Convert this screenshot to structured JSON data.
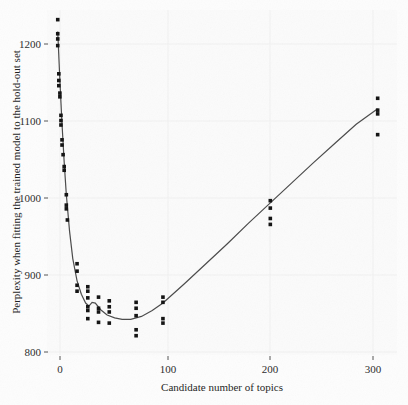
{
  "chart_data": {
    "type": "scatter",
    "title": "",
    "xlabel": "Candidate number of topics",
    "ylabel": "Perplexity when fitting the trained model to the hold-out set",
    "xlim": [
      -8,
      318
    ],
    "ylim": [
      780,
      1245
    ],
    "xticks": [
      0,
      100,
      200,
      300
    ],
    "xticklabels": [
      "0",
      "100",
      "200",
      "300"
    ],
    "yticks": [
      800,
      900,
      1000,
      1100,
      1200
    ],
    "yticklabels": [
      "800",
      "900",
      "1000",
      "1100",
      "1200"
    ],
    "grid": true,
    "legend": null,
    "point_color": "#111111",
    "line_color": "#4a4a4a",
    "panel_color": "#fbfbfb",
    "points": [
      {
        "x": 2,
        "y": 1232
      },
      {
        "x": 2,
        "y": 1213
      },
      {
        "x": 2,
        "y": 1206
      },
      {
        "x": 2,
        "y": 1197
      },
      {
        "x": 3,
        "y": 1159
      },
      {
        "x": 3,
        "y": 1150
      },
      {
        "x": 3,
        "y": 1143
      },
      {
        "x": 4,
        "y": 1133
      },
      {
        "x": 4,
        "y": 1128
      },
      {
        "x": 5,
        "y": 1103
      },
      {
        "x": 5,
        "y": 1096
      },
      {
        "x": 5,
        "y": 1090
      },
      {
        "x": 6,
        "y": 1070
      },
      {
        "x": 6,
        "y": 1063
      },
      {
        "x": 7,
        "y": 1050
      },
      {
        "x": 8,
        "y": 1034
      },
      {
        "x": 8,
        "y": 1029
      },
      {
        "x": 10,
        "y": 996
      },
      {
        "x": 10,
        "y": 982
      },
      {
        "x": 10,
        "y": 977
      },
      {
        "x": 11,
        "y": 962
      },
      {
        "x": 20,
        "y": 903
      },
      {
        "x": 20,
        "y": 893
      },
      {
        "x": 20,
        "y": 874
      },
      {
        "x": 20,
        "y": 866
      },
      {
        "x": 30,
        "y": 872
      },
      {
        "x": 30,
        "y": 866
      },
      {
        "x": 30,
        "y": 857
      },
      {
        "x": 30,
        "y": 845
      },
      {
        "x": 30,
        "y": 840
      },
      {
        "x": 30,
        "y": 829
      },
      {
        "x": 40,
        "y": 858
      },
      {
        "x": 40,
        "y": 843
      },
      {
        "x": 40,
        "y": 838
      },
      {
        "x": 40,
        "y": 824
      },
      {
        "x": 50,
        "y": 853
      },
      {
        "x": 50,
        "y": 845
      },
      {
        "x": 50,
        "y": 838
      },
      {
        "x": 50,
        "y": 823
      },
      {
        "x": 75,
        "y": 851
      },
      {
        "x": 75,
        "y": 843
      },
      {
        "x": 75,
        "y": 833
      },
      {
        "x": 75,
        "y": 814
      },
      {
        "x": 75,
        "y": 806
      },
      {
        "x": 100,
        "y": 858
      },
      {
        "x": 100,
        "y": 851
      },
      {
        "x": 100,
        "y": 829
      },
      {
        "x": 100,
        "y": 823
      },
      {
        "x": 200,
        "y": 988
      },
      {
        "x": 200,
        "y": 978
      },
      {
        "x": 200,
        "y": 964
      },
      {
        "x": 200,
        "y": 956
      },
      {
        "x": 300,
        "y": 1126
      },
      {
        "x": 300,
        "y": 1110
      },
      {
        "x": 300,
        "y": 1105
      },
      {
        "x": 300,
        "y": 1077
      }
    ],
    "fit_curve": [
      {
        "x": 2,
        "y": 1216
      },
      {
        "x": 4,
        "y": 1150
      },
      {
        "x": 6,
        "y": 1091
      },
      {
        "x": 8,
        "y": 1040
      },
      {
        "x": 10,
        "y": 996
      },
      {
        "x": 13,
        "y": 947
      },
      {
        "x": 16,
        "y": 910
      },
      {
        "x": 20,
        "y": 880
      },
      {
        "x": 24,
        "y": 862
      },
      {
        "x": 28,
        "y": 850
      },
      {
        "x": 31,
        "y": 846
      },
      {
        "x": 34,
        "y": 851
      },
      {
        "x": 37,
        "y": 850
      },
      {
        "x": 42,
        "y": 841
      },
      {
        "x": 48,
        "y": 834
      },
      {
        "x": 55,
        "y": 830
      },
      {
        "x": 62,
        "y": 828
      },
      {
        "x": 70,
        "y": 828
      },
      {
        "x": 80,
        "y": 832
      },
      {
        "x": 90,
        "y": 840
      },
      {
        "x": 100,
        "y": 850
      },
      {
        "x": 120,
        "y": 876
      },
      {
        "x": 140,
        "y": 903
      },
      {
        "x": 160,
        "y": 930
      },
      {
        "x": 180,
        "y": 958
      },
      {
        "x": 200,
        "y": 985
      },
      {
        "x": 220,
        "y": 1012
      },
      {
        "x": 240,
        "y": 1039
      },
      {
        "x": 260,
        "y": 1065
      },
      {
        "x": 280,
        "y": 1091
      },
      {
        "x": 300,
        "y": 1112
      }
    ]
  }
}
